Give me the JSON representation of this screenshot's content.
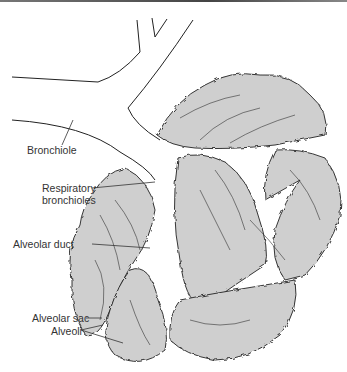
{
  "diagram": {
    "labels": {
      "bronchiole": "Bronchiole",
      "respiratory_bronchioles_1": "Respiratory",
      "respiratory_bronchioles_2": "bronchioles",
      "alveolar_duct": "Alveolar duct",
      "alveolar_sac": "Alveolar sac",
      "alveoli": "Alveoli"
    },
    "colors": {
      "tissue_fill": "#cfcfcf",
      "outline": "#222222",
      "label_text": "#333333"
    }
  }
}
